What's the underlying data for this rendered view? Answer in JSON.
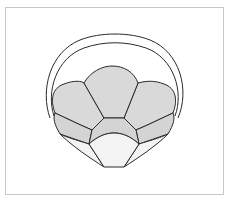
{
  "figure": {
    "colors": {
      "stroke": "#2a2a2a",
      "petal_fill": "#d9d9d9",
      "band_fill": "#d4d4d4",
      "cup_fill": "#f3f3f3",
      "background": "#ffffff",
      "frame": "#c8c8c8"
    },
    "parts": [
      "outer-handle-arc",
      "inner-handle-arc",
      "left-petal",
      "center-petal",
      "right-petal",
      "left-band",
      "center-band",
      "right-band",
      "left-cup-panel",
      "center-cup",
      "right-cup-panel"
    ]
  }
}
